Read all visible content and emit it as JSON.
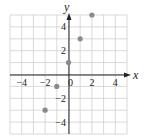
{
  "chart_data": {
    "type": "scatter",
    "title": "",
    "xlabel": "x",
    "ylabel": "y",
    "xlim": [
      -5,
      5
    ],
    "ylim": [
      -5,
      5
    ],
    "grid": true,
    "x_ticks": [
      -4,
      -2,
      0,
      2,
      4
    ],
    "y_ticks": [
      -4,
      -2,
      2,
      4
    ],
    "x_tick_labels": [
      "−4",
      "−2",
      "0",
      "2",
      "4"
    ],
    "y_tick_labels": [
      "−4",
      "−2",
      "2",
      "4"
    ],
    "series": [
      {
        "name": "points",
        "points": [
          {
            "x": -2,
            "y": -3
          },
          {
            "x": -1,
            "y": -1
          },
          {
            "x": 0,
            "y": 1
          },
          {
            "x": 1,
            "y": 3
          },
          {
            "x": 2,
            "y": 5
          }
        ],
        "color": "#8a8a8a"
      }
    ]
  },
  "colors": {
    "grid": "#cfcfcf",
    "axis": "#222222",
    "point": "#8a8a8a"
  }
}
